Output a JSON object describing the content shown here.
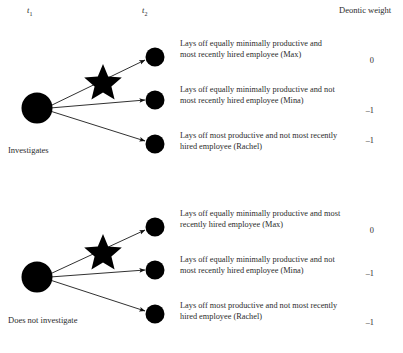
{
  "figure": {
    "headers": {
      "t1": "t",
      "t1_sub": "1",
      "t2": "t",
      "t2_sub": "2",
      "deontic_weight": "Deontic weight"
    },
    "groups": [
      {
        "branch_label": "Investigates",
        "outcomes": [
          {
            "text": "Lays off equally minimally productive and most recently hired employee (Max)",
            "weight": "0"
          },
          {
            "text": "Lays off equally minimally productive and not most recently hired employee (Mina)",
            "weight": "–1"
          },
          {
            "text": "Lays off most productive and not most recently hired employee (Rachel)",
            "weight": "–1"
          }
        ]
      },
      {
        "branch_label": "Does not investigate",
        "outcomes": [
          {
            "text": "Lays off equally minimally productive and most recently hired employee (Max)",
            "weight": "0"
          },
          {
            "text": "Lays off equally minimally productive and not most recently hired employee (Mina)",
            "weight": "–1"
          },
          {
            "text": "Lays off most productive and not most recently hired employee (Rachel)",
            "weight": "–1"
          }
        ]
      }
    ],
    "colors": {
      "node": "#000000",
      "edge": "#1a1a1a",
      "text": "#2b2b2b",
      "background": "#ffffff"
    }
  }
}
